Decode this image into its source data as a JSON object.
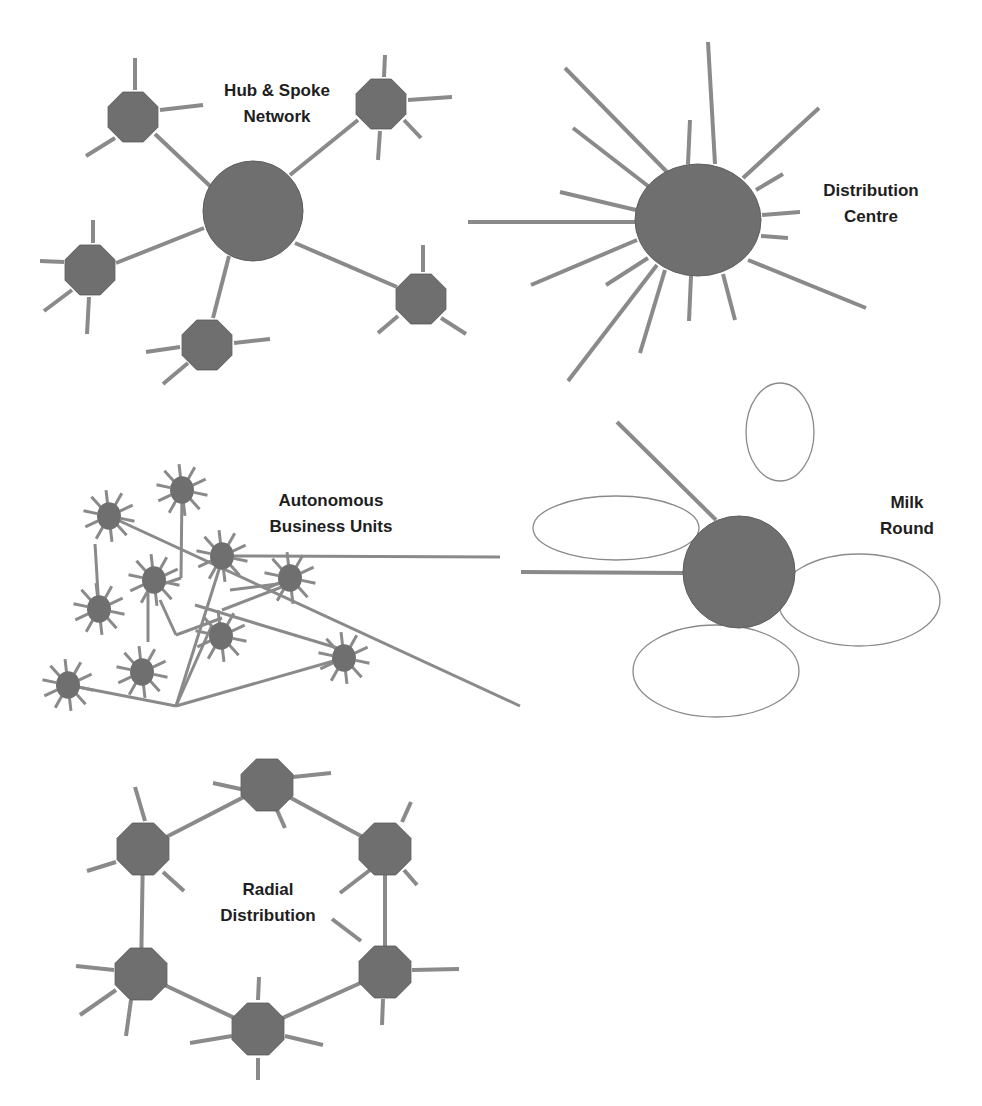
{
  "colors": {
    "node_fill": "#6f6f6f",
    "node_stroke": "#5e5e5e",
    "line": "#8a8a8a",
    "loop_stroke": "#8a8a8a",
    "label": "#1e1e1e",
    "background": "#ffffff"
  },
  "panels": {
    "hub_spoke": {
      "title_line1": "Hub & Spoke",
      "title_line2": "Network",
      "label_pos": [
        277,
        78
      ],
      "hub": {
        "cx": 253,
        "cy": 211,
        "r": 50
      },
      "satellites": [
        {
          "cx": 133,
          "cy": 117,
          "r": 27,
          "spokes": [
            [
              135,
              58,
              135,
              90
            ],
            [
              160,
              110,
              203,
              105
            ],
            [
              115,
              138,
              86,
              156
            ]
          ]
        },
        {
          "cx": 381,
          "cy": 104,
          "r": 27,
          "spokes": [
            [
              385,
              55,
              384,
              77
            ],
            [
              408,
              100,
              452,
              97
            ],
            [
              404,
              120,
              421,
              138
            ],
            [
              380,
              131,
              378,
              160
            ]
          ]
        },
        {
          "cx": 90,
          "cy": 270,
          "r": 27,
          "spokes": [
            [
              93,
              220,
              93,
              243
            ],
            [
              64,
              262,
              40,
              261
            ],
            [
              72,
              290,
              44,
              311
            ],
            [
              89,
              297,
              87,
              334
            ]
          ]
        },
        {
          "cx": 421,
          "cy": 299,
          "r": 27,
          "spokes": [
            [
              423,
              245,
              423,
              272
            ],
            [
              398,
              316,
              378,
              333
            ],
            [
              441,
              318,
              466,
              334
            ]
          ]
        },
        {
          "cx": 207,
          "cy": 345,
          "r": 27,
          "spokes": [
            [
              180,
              347,
              146,
              352
            ],
            [
              234,
              343,
              270,
              339
            ],
            [
              188,
              363,
              163,
              384
            ]
          ]
        }
      ],
      "links": [
        [
          155,
          134,
          210,
          186
        ],
        [
          290,
          175,
          358,
          120
        ],
        [
          116,
          263,
          204,
          228
        ],
        [
          295,
          243,
          397,
          287
        ],
        [
          229,
          256,
          213,
          318
        ]
      ]
    },
    "distribution_centre": {
      "title_line1": "Distribution",
      "title_line2": "Centre",
      "label_pos": [
        871,
        178
      ],
      "hub": {
        "cx": 698,
        "cy": 220,
        "rx": 63,
        "ry": 56
      },
      "spokes": [
        [
          667,
          172,
          565,
          68
        ],
        [
          648,
          186,
          573,
          128
        ],
        [
          636,
          210,
          560,
          192
        ],
        [
          635,
          222,
          468,
          222
        ],
        [
          637,
          240,
          531,
          285
        ],
        [
          648,
          258,
          606,
          285
        ],
        [
          657,
          265,
          568,
          381
        ],
        [
          665,
          270,
          640,
          353
        ],
        [
          691,
          276,
          689,
          321
        ],
        [
          723,
          274,
          735,
          320
        ],
        [
          748,
          260,
          866,
          308
        ],
        [
          761,
          236,
          788,
          238
        ],
        [
          762,
          215,
          800,
          212
        ],
        [
          756,
          190,
          783,
          174
        ],
        [
          743,
          178,
          819,
          108
        ],
        [
          715,
          164,
          708,
          42
        ],
        [
          688,
          164,
          690,
          120
        ]
      ]
    },
    "autonomous": {
      "title_line1": "Autonomous",
      "title_line2": "Business Units",
      "label_pos": [
        331,
        488
      ],
      "units": [
        {
          "cx": 109,
          "cy": 516,
          "r": 12
        },
        {
          "cx": 182,
          "cy": 490,
          "r": 12
        },
        {
          "cx": 99,
          "cy": 609,
          "r": 12
        },
        {
          "cx": 154,
          "cy": 580,
          "r": 12
        },
        {
          "cx": 222,
          "cy": 556,
          "r": 12
        },
        {
          "cx": 290,
          "cy": 578,
          "r": 12
        },
        {
          "cx": 221,
          "cy": 636,
          "r": 12
        },
        {
          "cx": 142,
          "cy": 672,
          "r": 12
        },
        {
          "cx": 68,
          "cy": 685,
          "r": 12
        },
        {
          "cx": 344,
          "cy": 658,
          "r": 12
        }
      ],
      "links": [
        [
          109,
          516,
          520,
          706
        ],
        [
          222,
          556,
          500,
          557
        ],
        [
          95,
          544,
          99,
          609
        ],
        [
          182,
          490,
          181,
          578
        ],
        [
          181,
          578,
          160,
          585
        ],
        [
          160,
          600,
          176,
          635
        ],
        [
          176,
          635,
          222,
          618
        ],
        [
          148,
          592,
          148,
          642
        ],
        [
          68,
          685,
          176,
          706
        ],
        [
          176,
          706,
          222,
          560
        ],
        [
          176,
          706,
          344,
          658
        ],
        [
          176,
          706,
          212,
          625
        ],
        [
          222,
          610,
          287,
          585
        ],
        [
          195,
          605,
          344,
          650
        ],
        [
          230,
          590,
          285,
          583
        ]
      ]
    },
    "milk_round": {
      "title_line1": "Milk",
      "title_line2": "Round",
      "label_pos": [
        907,
        490
      ],
      "hub": {
        "cx": 739,
        "cy": 572,
        "r": 56
      },
      "loops": [
        {
          "cx": 616,
          "cy": 528,
          "rx": 83,
          "ry": 32
        },
        {
          "cx": 780,
          "cy": 432,
          "rx": 34,
          "ry": 49
        },
        {
          "cx": 859,
          "cy": 600,
          "rx": 81,
          "ry": 46
        },
        {
          "cx": 716,
          "cy": 671,
          "rx": 83,
          "ry": 46
        }
      ],
      "spokes": [
        [
          716,
          520,
          617,
          422
        ],
        [
          683,
          573,
          521,
          572
        ]
      ]
    },
    "radial": {
      "title_line1": "Radial",
      "title_line2": "Distribution",
      "label_pos": [
        268,
        877
      ],
      "nodes": [
        {
          "cx": 267,
          "cy": 785,
          "r": 28,
          "spokes": [
            [
              213,
              783,
              245,
              790
            ],
            [
              293,
              777,
              331,
              773
            ],
            [
              276,
              808,
              285,
              828
            ]
          ]
        },
        {
          "cx": 385,
          "cy": 849,
          "r": 28,
          "spokes": [
            [
              402,
              822,
              411,
              802
            ],
            [
              370,
              870,
              340,
              893
            ],
            [
              404,
              870,
              417,
              885
            ]
          ]
        },
        {
          "cx": 385,
          "cy": 972,
          "r": 28,
          "spokes": [
            [
              361,
              941,
              332,
              919
            ],
            [
              412,
              970,
              459,
              969
            ],
            [
              383,
              999,
              382,
              1025
            ]
          ]
        },
        {
          "cx": 258,
          "cy": 1029,
          "r": 28,
          "spokes": [
            [
              258,
              1000,
              259,
              977
            ],
            [
              232,
              1036,
              190,
              1043
            ],
            [
              285,
              1036,
              323,
              1045
            ],
            [
              258,
              1058,
              258,
              1080
            ]
          ]
        },
        {
          "cx": 141,
          "cy": 974,
          "r": 28,
          "spokes": [
            [
              114,
              970,
              76,
              966
            ],
            [
              116,
              990,
              80,
              1015
            ],
            [
              131,
              1000,
              126,
              1036
            ]
          ]
        },
        {
          "cx": 143,
          "cy": 849,
          "r": 28,
          "spokes": [
            [
              145,
              821,
              135,
              787
            ],
            [
              116,
              862,
              87,
              871
            ],
            [
              163,
              872,
              184,
              891
            ]
          ]
        }
      ],
      "ring": [
        [
          267,
          785
        ],
        [
          385,
          849
        ],
        [
          385,
          972
        ],
        [
          258,
          1029
        ],
        [
          141,
          974
        ],
        [
          143,
          849
        ]
      ]
    }
  }
}
